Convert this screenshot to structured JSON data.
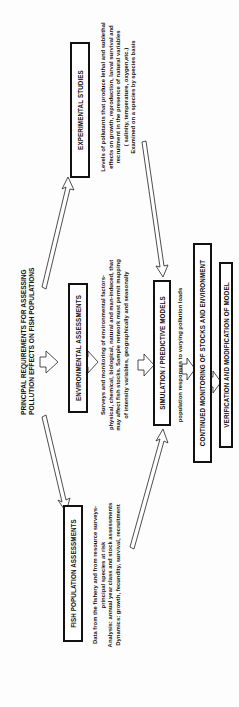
{
  "title": {
    "line1": "PRINCIPAL REQUIREMENTS FOR ASSESSING",
    "line2": "POLLUTION EFFECTS ON FISH POPULATIONS"
  },
  "boxes": {
    "experimental": "EXPERIMENTAL STUDIES",
    "environmental": "ENVIRONMENTAL ASSESSMENTS",
    "fish_population": "FISH POPULATION ASSESSMENTS",
    "simulation": "SIMULATION / PREDICTIVE MODELS",
    "continued_monitoring": "CONTINUED MONITORING OF STOCKS AND ENVIRONMENT",
    "verification": "VERIFICATION AND MODIFICATION OF MODEL"
  },
  "descriptions": {
    "experimental": [
      "Levels of pollutants that produce lethal and sublethal",
      "effects on growth, reproduction, larval survival and",
      "recruitment in the presence of natural variables",
      "( salinity, temperature, oxygen,etc.)",
      "Examined on a species by species basis"
    ],
    "environmental": [
      "Surveys and monitoring of environmental factors-",
      "physical, chemical, biological, natural and man-induced, that",
      "may affect  fish stocks. Sample network must permit mapping",
      "of intensity variables, geographically and seasonally"
    ],
    "fish_population": [
      "Data from the fishery and from resource surveys-",
      "principal species at risk",
      "Analysis: annual year class and stock assessments",
      "Dynamics: growth, fecundity, survival, recruitment"
    ],
    "simulation": "population responses   to varying pollution loads"
  },
  "orientation": {
    "rotation_deg": -90
  }
}
